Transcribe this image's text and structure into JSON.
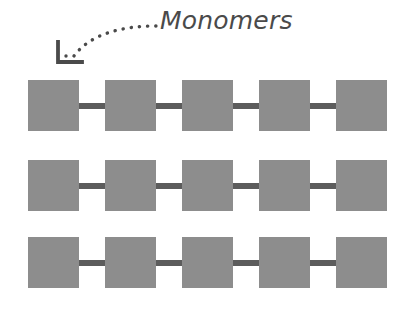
{
  "figure": {
    "background_color": "#ffffff"
  },
  "annotation": {
    "label": "Monomers",
    "label_color": "#4a4a4a",
    "arrow": {
      "style": "dotted-curved",
      "arrowhead": "corner-L",
      "color": "#4a4a4a",
      "points_to": "first monomer of row 1"
    }
  },
  "chain": {
    "monomer_color": "#8d8d8d",
    "bond_color": "#5c5c5c",
    "monomer_size_px": 51,
    "bond_length_px": 26,
    "row_count": 3,
    "monomers_per_row": 5,
    "rows": [
      {
        "name": "polymer-chain-row-1",
        "top_px": 80,
        "monomers": 5
      },
      {
        "name": "polymer-chain-row-2",
        "top_px": 160,
        "monomers": 5
      },
      {
        "name": "polymer-chain-row-3",
        "top_px": 237,
        "monomers": 5
      }
    ]
  }
}
